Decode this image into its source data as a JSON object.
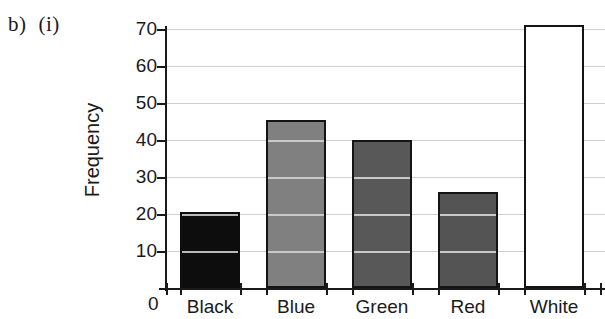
{
  "figure": {
    "part_label": "b)",
    "sub_label": "(i)"
  },
  "axes": {
    "y_title": "Frequency",
    "y_ticks": [
      70,
      60,
      50,
      40,
      30,
      20,
      10
    ],
    "y_zero_label": "0",
    "y_min": 0,
    "y_max": 74
  },
  "chart_data": {
    "type": "bar",
    "title": "",
    "xlabel": "",
    "ylabel": "Frequency",
    "categories": [
      "Black",
      "Blue",
      "Green",
      "Red",
      "White"
    ],
    "values": [
      20.5,
      45.5,
      40,
      26,
      71
    ],
    "ylim": [
      0,
      74
    ],
    "y_ticks": [
      0,
      10,
      20,
      30,
      40,
      50,
      60,
      70
    ],
    "grid": true,
    "legend": "none",
    "bar_colors": [
      "#0d0d0d",
      "#808080",
      "#585858",
      "#545454",
      "#ffffff"
    ],
    "bar_outline_color": "#141414"
  },
  "colors": {
    "gridline": "#cfcfcf",
    "axis": "#1a1a1a",
    "text": "#1a1a1a",
    "background": "#ffffff"
  }
}
